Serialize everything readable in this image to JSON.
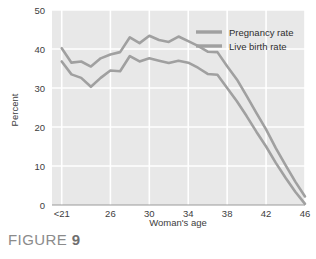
{
  "figure": {
    "caption_word": "FIGURE",
    "caption_number": "9"
  },
  "colors": {
    "plot_background": "#e8e8e8",
    "gridline": "#ffffff",
    "line": "#a0a0a0",
    "axis": "#9a9a9a",
    "tick_text": "#3d3d3d",
    "caption_text": "#8b8b8b"
  },
  "chart_data": {
    "type": "line",
    "title": "",
    "xlabel": "Woman's age",
    "ylabel": "Percent",
    "xlim": [
      20,
      46
    ],
    "ylim": [
      0,
      50
    ],
    "grid": true,
    "legend_position": "top-right",
    "xticks": [
      {
        "value": 21,
        "label": "<21"
      },
      {
        "value": 26,
        "label": "26"
      },
      {
        "value": 30,
        "label": "30"
      },
      {
        "value": 34,
        "label": "34"
      },
      {
        "value": 38,
        "label": "38"
      },
      {
        "value": 42,
        "label": "42"
      },
      {
        "value": 46,
        "label": "46"
      }
    ],
    "yticks": [
      {
        "value": 0,
        "label": "0"
      },
      {
        "value": 10,
        "label": "10"
      },
      {
        "value": 20,
        "label": "20"
      },
      {
        "value": 30,
        "label": "30"
      },
      {
        "value": 40,
        "label": "40"
      },
      {
        "value": 50,
        "label": "50"
      }
    ],
    "x": [
      21,
      22,
      23,
      24,
      25,
      26,
      27,
      28,
      29,
      30,
      31,
      32,
      33,
      34,
      35,
      36,
      37,
      38,
      39,
      40,
      41,
      42,
      43,
      44,
      45,
      46
    ],
    "series": [
      {
        "name": "Pregnancy rate",
        "color": "#a0a0a0",
        "values": [
          40.2,
          36.5,
          36.8,
          35.5,
          37.6,
          38.6,
          39.2,
          43.0,
          41.5,
          43.4,
          42.3,
          41.8,
          43.2,
          42.0,
          40.8,
          39.3,
          39.2,
          35.6,
          32.2,
          28.0,
          23.6,
          19.4,
          14.6,
          10.2,
          6.0,
          2.2
        ]
      },
      {
        "name": "Live birth rate",
        "color": "#a0a0a0",
        "values": [
          36.8,
          33.5,
          32.6,
          30.3,
          32.6,
          34.5,
          34.3,
          38.2,
          36.8,
          37.6,
          37.0,
          36.4,
          37.0,
          36.5,
          35.2,
          33.6,
          33.4,
          30.0,
          26.6,
          22.8,
          18.8,
          15.0,
          10.8,
          7.0,
          3.4,
          0.3
        ]
      }
    ],
    "legend": [
      {
        "label": "Pregnancy rate"
      },
      {
        "label": "Live birth rate"
      }
    ]
  }
}
